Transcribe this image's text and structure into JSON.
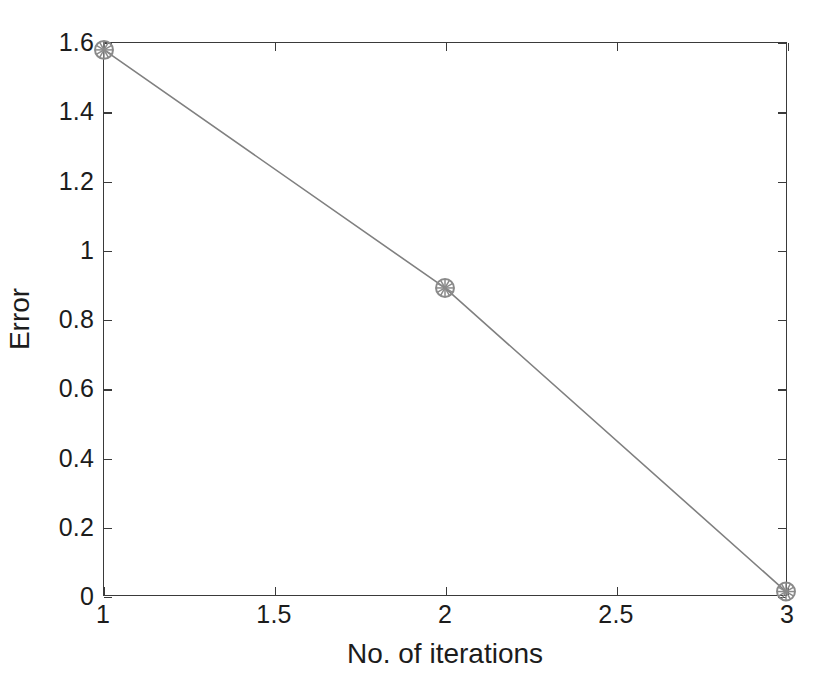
{
  "chart_data": {
    "type": "line",
    "title": "",
    "xlabel": "No. of iterations",
    "ylabel": "Error",
    "xlim": [
      1,
      3
    ],
    "ylim": [
      0,
      1.6
    ],
    "grid": false,
    "legend": null,
    "x": [
      1,
      2,
      3
    ],
    "values": [
      1.58,
      0.89,
      0.01
    ],
    "series": [
      {
        "name": "Error",
        "x": [
          1,
          2,
          3
        ],
        "values": [
          1.58,
          0.89,
          0.01
        ],
        "line_color": "#808080",
        "marker": "circle-asterisk",
        "marker_color": "#8a8a8a"
      }
    ],
    "xticks": [
      1,
      1.5,
      2,
      2.5,
      3
    ],
    "xtick_labels": [
      "1",
      "1.5",
      "2",
      "2.5",
      "3"
    ],
    "yticks": [
      0,
      0.2,
      0.4,
      0.6,
      0.8,
      1,
      1.2,
      1.4,
      1.6
    ],
    "ytick_labels": [
      "0",
      "0.2",
      "0.4",
      "0.6",
      "0.8",
      "1",
      "1.2",
      "1.4",
      "1.6"
    ],
    "tick_direction": "in",
    "box": true,
    "background_color": "#ffffff",
    "axis_color": "#3a3a3a",
    "text_color": "#1c1c1c"
  }
}
